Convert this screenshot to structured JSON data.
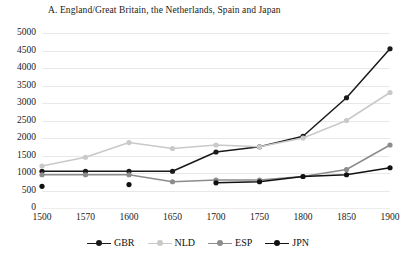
{
  "chart_data": {
    "type": "line",
    "title": "A. England/Great Britain, the Netherlands, Spain and Japan",
    "xlabel": "",
    "ylabel": "",
    "categories": [
      "1500",
      "1570",
      "1600",
      "1650",
      "1700",
      "1750",
      "1800",
      "1850",
      "1900"
    ],
    "ylim": [
      0,
      5000
    ],
    "yticks": [
      "0",
      "500",
      "1000",
      "1500",
      "2000",
      "2500",
      "3000",
      "3500",
      "4000",
      "4500",
      "5000"
    ],
    "grid": true,
    "legend_position": "bottom",
    "series": [
      {
        "name": "GBR",
        "color": "#1a1a1a",
        "values": [
          1050,
          1050,
          1050,
          1050,
          1600,
          1750,
          2050,
          3150,
          4550
        ]
      },
      {
        "name": "NLD",
        "color": "#c9c9c9",
        "values": [
          1200,
          1450,
          1870,
          1700,
          1800,
          1750,
          2000,
          2500,
          3300
        ]
      },
      {
        "name": "ESP",
        "color": "#8c8c8c",
        "values": [
          950,
          950,
          950,
          750,
          800,
          800,
          900,
          1100,
          1800
        ]
      },
      {
        "name": "JPN",
        "color": "#111111",
        "values": [
          620,
          null,
          670,
          null,
          720,
          750,
          900,
          950,
          1150
        ]
      }
    ]
  },
  "legend": {
    "items": [
      {
        "label": "GBR"
      },
      {
        "label": "NLD"
      },
      {
        "label": "ESP"
      },
      {
        "label": "JPN"
      }
    ]
  }
}
